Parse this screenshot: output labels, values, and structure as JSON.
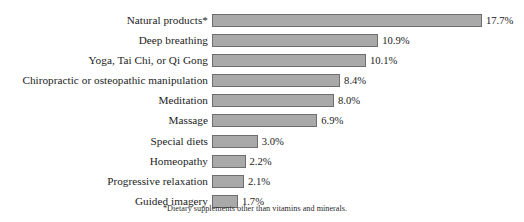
{
  "chart_data": {
    "type": "bar",
    "orientation": "horizontal",
    "title": "",
    "subtitle": "",
    "xlabel": "",
    "ylabel": "",
    "grid": false,
    "legend": null,
    "xlim": [
      0,
      17.7
    ],
    "categories": [
      "Natural products*",
      "Deep breathing",
      "Yoga, Tai Chi, or Qi Gong",
      "Chiropractic or osteopathic manipulation",
      "Meditation",
      "Massage",
      "Special diets",
      "Homeopathy",
      "Progressive relaxation",
      "Guided imagery"
    ],
    "values": [
      17.7,
      10.9,
      10.1,
      8.4,
      8.0,
      6.9,
      3.0,
      2.2,
      2.1,
      1.7
    ],
    "value_labels": [
      "17.7%",
      "10.9%",
      "10.1%",
      "8.4%",
      "8.0%",
      "6.9%",
      "3.0%",
      "2.2%",
      "2.1%",
      "1.7%"
    ],
    "annotations": [
      "*Dietary supplements other than vitamins and minerals."
    ],
    "colors": {
      "bar_fill": "#a9a9a9",
      "bar_border": "#6e6e6e",
      "text": "#1b1b1b",
      "background": "#ffffff"
    },
    "px_per_unit": 15.25
  },
  "footnote": "*Dietary supplements other than vitamins and minerals."
}
